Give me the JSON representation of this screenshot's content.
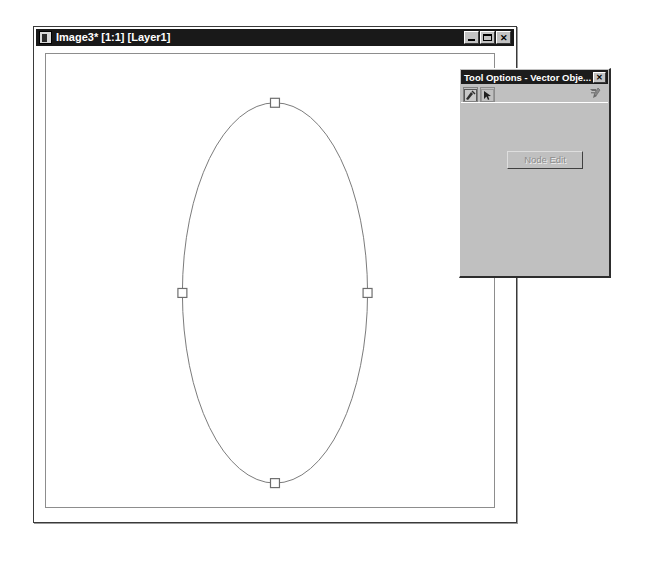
{
  "image_window": {
    "title": "Image3* [1:1] [Layer1]",
    "icon": "image-document-icon",
    "buttons": {
      "minimize": "_",
      "maximize": "□",
      "close": "✕"
    },
    "canvas": {
      "background": "#ffffff",
      "shape": {
        "type": "ellipse",
        "stroke": "#7a7a7a",
        "fill": "none",
        "center_x": 274,
        "center_y": 292,
        "radius_x": 93,
        "radius_y": 191,
        "handles": [
          {
            "name": "handle-top",
            "x": 274,
            "y": 101
          },
          {
            "name": "handle-right",
            "x": 367,
            "y": 292
          },
          {
            "name": "handle-bottom",
            "x": 274,
            "y": 483
          },
          {
            "name": "handle-left",
            "x": 181,
            "y": 292
          }
        ]
      }
    }
  },
  "tool_options": {
    "title": "Tool Options - Vector Obje...",
    "close_label": "✕",
    "toolbar": {
      "icons": [
        {
          "name": "vector-object-icon",
          "label": "Vector Object"
        },
        {
          "name": "node-pointer-icon",
          "label": "Node Pointer"
        }
      ],
      "help_icon": "whats-this-help-icon"
    },
    "node_edit_label": "Node Edit",
    "node_edit_enabled": false
  },
  "colors": {
    "titlebar": "#191919",
    "face": "#c0c0c0",
    "shape_stroke": "#7a7a7a",
    "disabled_text": "#8d8d8d"
  }
}
